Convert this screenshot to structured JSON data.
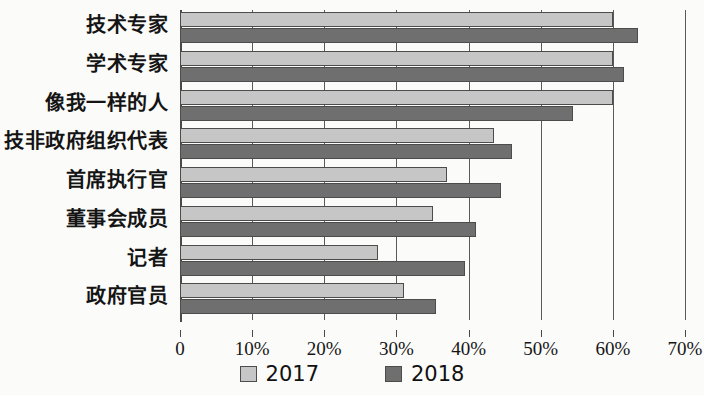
{
  "chart_data": {
    "type": "bar",
    "orientation": "horizontal",
    "title": "",
    "xlabel": "",
    "ylabel": "",
    "xlim": [
      0,
      70
    ],
    "xticks": [
      0,
      10,
      20,
      30,
      40,
      50,
      60,
      70
    ],
    "xtick_labels": [
      "0",
      "10%",
      "20%",
      "30%",
      "40%",
      "50%",
      "60%",
      "70%"
    ],
    "grid": true,
    "legend_position": "bottom",
    "categories": [
      "技术专家",
      "学术专家",
      "像我一样的人",
      "技非政府组织代表",
      "首席执行官",
      "董事会成员",
      "记者",
      "政府官员"
    ],
    "series": [
      {
        "name": "2017",
        "color": "#c6c6c6",
        "values": [
          60,
          60,
          60,
          43.5,
          37,
          35,
          27.5,
          31
        ]
      },
      {
        "name": "2018",
        "color": "#6f6f6f",
        "values": [
          63.5,
          61.5,
          54.5,
          46,
          44.5,
          41,
          39.5,
          35.5
        ]
      }
    ]
  },
  "legend": {
    "items": [
      {
        "label": "2017",
        "swatch": "light-gray-swatch"
      },
      {
        "label": "2018",
        "swatch": "dark-gray-swatch"
      }
    ]
  }
}
